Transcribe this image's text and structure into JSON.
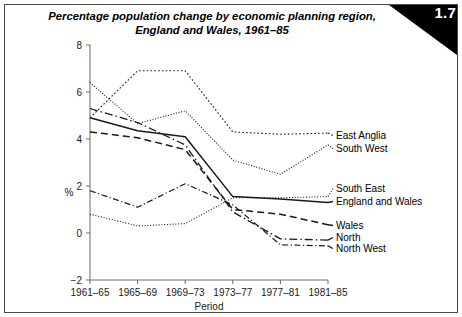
{
  "figure": {
    "number": "1.7",
    "title_line1": "Percentage population change by economic planning region,",
    "title_line2": "England and Wales, 1961–85"
  },
  "chart_data": {
    "type": "line",
    "title": "Percentage population change by economic planning region, England and Wales, 1961–85",
    "xlabel": "Period",
    "ylabel": "%",
    "categories": [
      "1961–65",
      "1965–69",
      "1969–73",
      "1973–77",
      "1977–81",
      "1981–85"
    ],
    "ylim": [
      -2,
      8
    ],
    "yticks": [
      -2,
      0,
      2,
      4,
      6,
      8
    ],
    "ytick_labels": [
      "−2",
      "0",
      "2",
      "4",
      "6",
      "8"
    ],
    "grid": false,
    "legend_position": "right-inline",
    "series": [
      {
        "name": "East Anglia",
        "dash": "coarse-dotted",
        "stroke_width": 1.1,
        "dasharray": "1.6,2.2",
        "values": [
          4.9,
          6.9,
          6.9,
          4.3,
          4.2,
          4.25
        ]
      },
      {
        "name": "South West",
        "dash": "fine-dotted",
        "stroke_width": 1.1,
        "dasharray": "1,1.7",
        "values": [
          6.4,
          4.65,
          5.2,
          3.1,
          2.5,
          3.75
        ]
      },
      {
        "name": "South East",
        "dash": "fine-dotted",
        "stroke_width": 1.1,
        "dasharray": "1,1.8",
        "values": [
          0.8,
          0.3,
          0.4,
          1.5,
          1.5,
          1.55
        ]
      },
      {
        "name": "England and Wales",
        "dash": "solid",
        "stroke_width": 1.5,
        "dasharray": "none",
        "values": [
          4.9,
          4.35,
          4.1,
          1.55,
          1.45,
          1.3
        ]
      },
      {
        "name": "Wales",
        "dash": "long-dash",
        "stroke_width": 1.5,
        "dasharray": "7,4",
        "values": [
          4.3,
          4.05,
          3.55,
          1.0,
          0.8,
          0.35
        ]
      },
      {
        "name": "North",
        "dash": "dash-dot",
        "stroke_width": 1.3,
        "dasharray": "8,3,1.5,3",
        "values": [
          5.3,
          4.7,
          3.75,
          0.9,
          -0.25,
          -0.3
        ]
      },
      {
        "name": "North West",
        "dash": "dash-dot-dot",
        "stroke_width": 1.2,
        "dasharray": "6,2.5,1.2,2.5",
        "values": [
          1.8,
          1.1,
          2.1,
          1.2,
          -0.5,
          -0.55
        ]
      }
    ],
    "legend_labels": [
      "East Anglia",
      "South West",
      "South East",
      "England and Wales",
      "Wales",
      "North",
      "North West"
    ]
  }
}
